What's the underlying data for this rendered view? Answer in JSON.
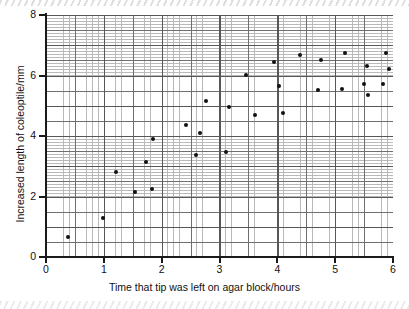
{
  "chart_data": {
    "type": "scatter",
    "title": "",
    "xlabel": "Time that tip was left on agar block/hours",
    "ylabel": "Increased length of coleoptile/mm",
    "xlim": [
      0,
      6
    ],
    "ylim": [
      0,
      8
    ],
    "xticks": [
      "0",
      "1",
      "2",
      "3",
      "4",
      "5",
      "6"
    ],
    "xtick_values": [
      0,
      1,
      2,
      3,
      4,
      5,
      6
    ],
    "yticks": [
      "0",
      "2",
      "4",
      "6",
      "8"
    ],
    "ytick_values": [
      0,
      2,
      4,
      6,
      8
    ],
    "grid": "graph-paper, minor 0.1 units, major 0.5 units, bold 1 unit",
    "legend": "none",
    "marker": "filled-circle",
    "marker_color": "#111111",
    "points": [
      {
        "x": 0.38,
        "y": 0.65
      },
      {
        "x": 0.99,
        "y": 1.29
      },
      {
        "x": 1.21,
        "y": 2.81
      },
      {
        "x": 1.54,
        "y": 2.15
      },
      {
        "x": 1.73,
        "y": 3.14
      },
      {
        "x": 1.83,
        "y": 2.25
      },
      {
        "x": 1.85,
        "y": 3.9
      },
      {
        "x": 2.42,
        "y": 4.36
      },
      {
        "x": 2.6,
        "y": 3.37
      },
      {
        "x": 2.66,
        "y": 4.1
      },
      {
        "x": 2.77,
        "y": 5.16
      },
      {
        "x": 3.11,
        "y": 3.47
      },
      {
        "x": 3.17,
        "y": 4.96
      },
      {
        "x": 3.46,
        "y": 6.02
      },
      {
        "x": 3.62,
        "y": 4.69
      },
      {
        "x": 3.95,
        "y": 6.45
      },
      {
        "x": 4.03,
        "y": 5.65
      },
      {
        "x": 4.1,
        "y": 4.76
      },
      {
        "x": 4.4,
        "y": 6.68
      },
      {
        "x": 4.71,
        "y": 5.52
      },
      {
        "x": 4.76,
        "y": 6.51
      },
      {
        "x": 5.12,
        "y": 5.55
      },
      {
        "x": 5.17,
        "y": 6.74
      },
      {
        "x": 5.5,
        "y": 5.72
      },
      {
        "x": 5.55,
        "y": 6.32
      },
      {
        "x": 5.57,
        "y": 5.35
      },
      {
        "x": 5.83,
        "y": 5.72
      },
      {
        "x": 5.88,
        "y": 6.74
      },
      {
        "x": 5.93,
        "y": 6.21
      }
    ]
  },
  "colors": {
    "marker": "#111111",
    "axis": "#1a1a1a",
    "grid_minor": "#b9b9b9",
    "grid_major": "#6f6f6f",
    "grid_bold": "#575757",
    "background": "#ffffff"
  }
}
